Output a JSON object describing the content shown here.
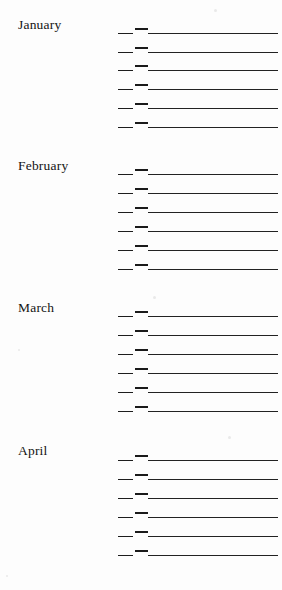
{
  "document": {
    "type": "ruled-ledger-form",
    "background_color": "#fdfdfd",
    "ink_color": "#1d1d1d",
    "page_width": 282,
    "page_height": 590
  },
  "sections": [
    {
      "label": "January",
      "label_top": 17,
      "block_top": 0,
      "rows": [
        {
          "top": 22
        },
        {
          "top": 41
        },
        {
          "top": 59
        },
        {
          "top": 78
        },
        {
          "top": 97
        },
        {
          "top": 116
        }
      ]
    },
    {
      "label": "February",
      "label_top": 158,
      "block_top": 0,
      "rows": [
        {
          "top": 163
        },
        {
          "top": 182
        },
        {
          "top": 201
        },
        {
          "top": 220
        },
        {
          "top": 239
        },
        {
          "top": 258
        }
      ]
    },
    {
      "label": "March",
      "label_top": 300,
      "block_top": 0,
      "rows": [
        {
          "top": 305
        },
        {
          "top": 324
        },
        {
          "top": 343
        },
        {
          "top": 362
        },
        {
          "top": 381
        },
        {
          "top": 400
        }
      ]
    },
    {
      "label": "April",
      "label_top": 443,
      "block_top": 0,
      "rows": [
        {
          "top": 449
        },
        {
          "top": 468
        },
        {
          "top": 487
        },
        {
          "top": 506
        },
        {
          "top": 525
        },
        {
          "top": 544
        }
      ]
    }
  ],
  "row_geometry": {
    "dash_base_left": 118,
    "dash_base_width": 15,
    "dash_raised_left": 135,
    "dash_raised_width": 13,
    "rule_long_left": 148,
    "rule_long_width": 130
  },
  "speckles": [
    {
      "left": 214,
      "top": 9,
      "size": 3
    },
    {
      "left": 153,
      "top": 296,
      "size": 3
    },
    {
      "left": 18,
      "top": 349,
      "size": 2
    },
    {
      "left": 228,
      "top": 436,
      "size": 3
    },
    {
      "left": 6,
      "top": 575,
      "size": 2
    }
  ]
}
